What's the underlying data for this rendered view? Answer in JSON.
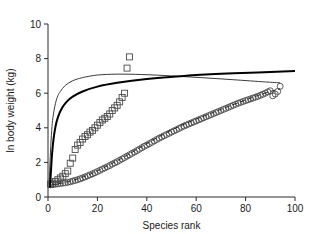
{
  "chart_data": {
    "type": "scatter",
    "title": "",
    "xlabel": "Species rank",
    "ylabel": "ln body weight (kg)",
    "xlim": [
      0,
      100
    ],
    "ylim": [
      0,
      10
    ],
    "xticks": [
      0,
      20,
      40,
      60,
      80,
      100
    ],
    "yticks": [
      0,
      2,
      4,
      6,
      8,
      10
    ],
    "xtick_labels": [
      "0",
      "20",
      "40",
      "60",
      "80",
      "100"
    ],
    "ytick_labels": [
      "0",
      "2",
      "4",
      "6",
      "8",
      "10"
    ],
    "grid": false,
    "legend": "none",
    "series": [
      {
        "name": "open-squares",
        "marker": "square",
        "style": "markers",
        "x": [
          1,
          2,
          3,
          4,
          5,
          6,
          7,
          8,
          9,
          10,
          11,
          12,
          13,
          14,
          15,
          16,
          17,
          18,
          19,
          20,
          21,
          22,
          23,
          24,
          25,
          26,
          27,
          28,
          29,
          30,
          31,
          32,
          33
        ],
        "y": [
          0.75,
          0.8,
          0.9,
          1.0,
          1.1,
          1.2,
          1.35,
          1.5,
          1.95,
          2.25,
          2.75,
          3.0,
          3.15,
          3.35,
          3.5,
          3.6,
          3.75,
          3.85,
          4.0,
          4.15,
          4.3,
          4.45,
          4.55,
          4.65,
          4.8,
          5.0,
          5.15,
          5.3,
          5.5,
          5.75,
          6.0,
          7.45,
          8.1
        ]
      },
      {
        "name": "open-circles",
        "marker": "circle",
        "style": "markers",
        "x": [
          1,
          2,
          3,
          4,
          5,
          6,
          7,
          8,
          9,
          10,
          11,
          12,
          13,
          14,
          15,
          16,
          17,
          18,
          19,
          20,
          21,
          22,
          23,
          24,
          25,
          26,
          27,
          28,
          29,
          30,
          31,
          32,
          33,
          34,
          35,
          36,
          37,
          38,
          39,
          40,
          41,
          42,
          43,
          44,
          45,
          46,
          47,
          48,
          49,
          50,
          51,
          52,
          53,
          54,
          55,
          56,
          57,
          58,
          59,
          60,
          61,
          62,
          63,
          64,
          65,
          66,
          67,
          68,
          69,
          70,
          71,
          72,
          73,
          74,
          75,
          76,
          77,
          78,
          79,
          80,
          81,
          82,
          83,
          84,
          85,
          86,
          87,
          88,
          89,
          90,
          91,
          92,
          93,
          94
        ],
        "y": [
          0.7,
          0.72,
          0.74,
          0.76,
          0.78,
          0.8,
          0.82,
          0.85,
          0.88,
          0.92,
          0.96,
          1.0,
          1.05,
          1.1,
          1.16,
          1.22,
          1.28,
          1.34,
          1.4,
          1.47,
          1.54,
          1.61,
          1.68,
          1.75,
          1.82,
          1.9,
          1.97,
          2.04,
          2.12,
          2.2,
          2.28,
          2.36,
          2.44,
          2.52,
          2.6,
          2.68,
          2.76,
          2.85,
          2.93,
          3.0,
          3.08,
          3.16,
          3.24,
          3.32,
          3.4,
          3.47,
          3.54,
          3.61,
          3.68,
          3.75,
          3.82,
          3.89,
          3.96,
          4.03,
          4.1,
          4.16,
          4.22,
          4.28,
          4.34,
          4.4,
          4.46,
          4.52,
          4.58,
          4.64,
          4.7,
          4.76,
          4.82,
          4.88,
          4.94,
          5.0,
          5.06,
          5.12,
          5.18,
          5.24,
          5.3,
          5.36,
          5.42,
          5.47,
          5.52,
          5.57,
          5.62,
          5.67,
          5.72,
          5.77,
          5.82,
          5.88,
          5.94,
          6.0,
          6.08,
          6.14,
          5.85,
          5.95,
          6.1,
          6.4
        ]
      },
      {
        "name": "thin-upper-curve",
        "style": "line",
        "linestyle": "solid",
        "weight": "thin",
        "x": [
          0.4,
          0.7,
          1.0,
          1.5,
          2.0,
          3.0,
          4.0,
          5.0,
          7.0,
          10.0,
          14.0,
          20.0,
          28.0,
          38.0,
          50.0,
          62.0,
          75.0,
          88.0,
          94.0
        ],
        "y": [
          0.55,
          1.6,
          2.6,
          3.85,
          4.6,
          5.4,
          5.85,
          6.1,
          6.45,
          6.72,
          6.9,
          7.05,
          7.1,
          7.08,
          7.0,
          6.9,
          6.78,
          6.65,
          6.6
        ]
      },
      {
        "name": "thick-lower-curve",
        "style": "line",
        "linestyle": "solid",
        "weight": "thick",
        "x": [
          0.8,
          1.2,
          1.6,
          2.2,
          3.0,
          4.0,
          5.5,
          7.5,
          10.0,
          14.0,
          20.0,
          28.0,
          40.0,
          55.0,
          70.0,
          85.0,
          95.0,
          100.0
        ],
        "y": [
          0.55,
          1.5,
          2.4,
          3.3,
          4.05,
          4.6,
          5.1,
          5.5,
          5.8,
          6.1,
          6.38,
          6.6,
          6.82,
          7.0,
          7.12,
          7.2,
          7.25,
          7.28
        ]
      },
      {
        "name": "dashed-lower-curve",
        "style": "line",
        "linestyle": "dashed",
        "weight": "thin",
        "x": [
          1,
          6,
          12,
          18,
          24,
          30,
          36,
          42,
          48,
          54,
          60,
          66,
          72,
          78,
          84,
          90,
          94
        ],
        "y": [
          0.68,
          0.82,
          1.05,
          1.38,
          1.8,
          2.25,
          2.75,
          3.25,
          3.72,
          4.14,
          4.5,
          4.84,
          5.18,
          5.5,
          5.82,
          6.1,
          6.25
        ]
      }
    ]
  }
}
